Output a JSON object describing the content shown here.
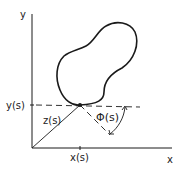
{
  "diagram": {
    "axes": {
      "x_label": "x",
      "y_label": "y"
    },
    "markers": {
      "x_tick_label": "x(s)",
      "y_tick_label": "y(s)"
    },
    "vectors": {
      "position_label": "z(s)"
    },
    "angle": {
      "label": "Φ(s)"
    },
    "colors": {
      "stroke": "#1a1a1a",
      "background": "#ffffff"
    }
  }
}
